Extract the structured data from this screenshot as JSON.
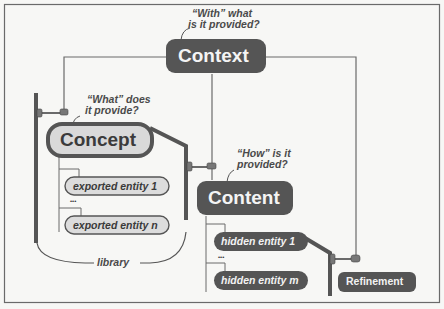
{
  "diagram": {
    "colors": {
      "background": "#f7f7f5",
      "frame": "#6a6a6a",
      "dark_node": "#555555",
      "light_node_fill": "#d9d9d9",
      "light_node_border": "#555555",
      "line": "#6a6a6a",
      "text_dark": "#3a3a3a",
      "text_light": "#f2f2f2"
    },
    "nodes": {
      "context": {
        "label": "Context",
        "question": [
          "“With” what",
          "is it provided?"
        ]
      },
      "concept": {
        "label": "Concept",
        "question": [
          "“What” does",
          "it provide?"
        ]
      },
      "content": {
        "label": "Content",
        "question": [
          "“How” is it",
          "provided?"
        ]
      },
      "refinement": {
        "label": "Refinement"
      }
    },
    "exported_entities": [
      {
        "label": "exported entity 1"
      },
      {
        "label": "exported entity n"
      }
    ],
    "hidden_entities": [
      {
        "label": "hidden entity 1"
      },
      {
        "label": "hidden entity m"
      }
    ],
    "ellipsis": "•••",
    "library_label": "library"
  }
}
